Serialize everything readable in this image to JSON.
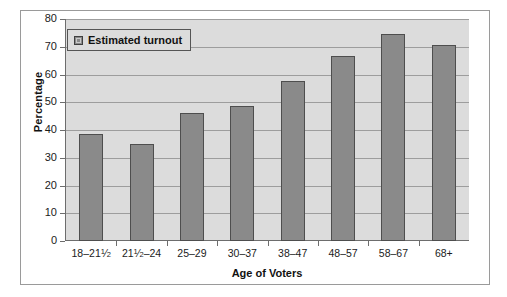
{
  "chart_data": {
    "type": "bar",
    "title": "",
    "xlabel": "Age of Voters",
    "ylabel": "Percentage",
    "ylim": [
      0,
      80
    ],
    "ytick_step": 10,
    "yticks": [
      0,
      10,
      20,
      30,
      40,
      50,
      60,
      70,
      80
    ],
    "grid": true,
    "legend_position": "top-left",
    "categories": [
      "18–21¹⁄₂",
      "21¹⁄₂–24",
      "25–29",
      "30–37",
      "38–47",
      "48–57",
      "58–67",
      "68+"
    ],
    "category_parts": [
      {
        "pre": "18–21",
        "num": "1",
        "den": "2",
        "post": ""
      },
      {
        "pre": "21",
        "num": "1",
        "den": "2",
        "post": "–24"
      },
      {
        "pre": "25–29",
        "num": "",
        "den": "",
        "post": ""
      },
      {
        "pre": "30–37",
        "num": "",
        "den": "",
        "post": ""
      },
      {
        "pre": "38–47",
        "num": "",
        "den": "",
        "post": ""
      },
      {
        "pre": "48–57",
        "num": "",
        "den": "",
        "post": ""
      },
      {
        "pre": "58–67",
        "num": "",
        "den": "",
        "post": ""
      },
      {
        "pre": "68+",
        "num": "",
        "den": "",
        "post": ""
      }
    ],
    "series": [
      {
        "name": "Estimated turnout",
        "values": [
          38.5,
          35.0,
          46.0,
          48.8,
          57.5,
          66.5,
          74.5,
          70.7
        ]
      }
    ],
    "colors": {
      "bar_fill": "#8a8a8a",
      "bar_border": "#4e4e4e",
      "plot_background": "#dcdcdc",
      "gridline": "#9d9d9d",
      "axis": "#6d6d6d",
      "text": "#111111",
      "figure_background": "#ffffff",
      "figure_border": "#9a9a9a"
    }
  },
  "legend": {
    "entries": [
      {
        "label": "Estimated turnout",
        "swatch": "legend-swatch-estimated-turnout"
      }
    ]
  }
}
